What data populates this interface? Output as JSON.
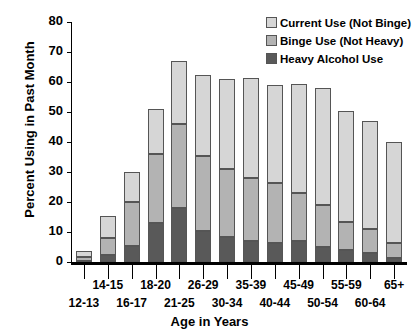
{
  "chart_data": {
    "type": "bar",
    "stacked": true,
    "title": "",
    "xlabel": "Age in Years",
    "ylabel": "Percent Using in Past Month",
    "ylim": [
      0,
      80
    ],
    "yticks": [
      0,
      10,
      20,
      30,
      40,
      50,
      60,
      70,
      80
    ],
    "grid": false,
    "legend_position": "top-right",
    "categories": [
      "12-13",
      "14-15",
      "16-17",
      "18-20",
      "21-25",
      "26-29",
      "30-34",
      "35-39",
      "40-44",
      "45-49",
      "50-54",
      "55-59",
      "60-64",
      "65+"
    ],
    "series": [
      {
        "name": "Heavy Alcohol Use",
        "color": "#595959",
        "values": [
          0.5,
          2.5,
          5.5,
          13.0,
          18.0,
          10.5,
          8.5,
          7.0,
          6.5,
          7.0,
          5.0,
          4.0,
          3.0,
          1.5
        ]
      },
      {
        "name": "Binge Use (Not Heavy)",
        "color": "#b3b3b3",
        "values": [
          1.2,
          5.5,
          14.5,
          23.0,
          28.0,
          25.0,
          22.5,
          21.0,
          20.0,
          16.0,
          14.0,
          9.5,
          8.0,
          5.0
        ]
      },
      {
        "name": "Current Use (Not Binge)",
        "color": "#d6d6d6",
        "values": [
          2.0,
          7.5,
          10.0,
          15.0,
          21.0,
          27.0,
          30.0,
          33.5,
          32.5,
          36.5,
          39.0,
          37.0,
          36.0,
          33.5
        ]
      }
    ],
    "totals": [
      3.7,
      15.5,
      30.0,
      51.0,
      67.0,
      62.5,
      61.0,
      61.5,
      59.0,
      59.5,
      58.0,
      50.5,
      47.0,
      40.0
    ],
    "cumulative_tops": {
      "heavy": [
        0.5,
        2.5,
        5.5,
        13.0,
        18.0,
        10.5,
        8.5,
        7.0,
        6.5,
        7.0,
        5.0,
        4.0,
        3.0,
        1.5
      ],
      "binge": [
        1.7,
        8.0,
        20.0,
        36.0,
        46.0,
        35.5,
        31.0,
        28.0,
        26.5,
        23.0,
        19.0,
        13.5,
        11.0,
        6.5
      ],
      "current": [
        3.7,
        15.5,
        30.0,
        51.0,
        67.0,
        62.5,
        61.0,
        61.5,
        59.0,
        59.5,
        58.0,
        50.5,
        47.0,
        40.0
      ]
    }
  },
  "axis": {
    "ylabel": "Percent Using in Past Month",
    "xlabel": "Age in Years",
    "yticks": [
      "80",
      "70",
      "60",
      "50",
      "40",
      "30",
      "20",
      "10",
      "0"
    ],
    "xticks_row_upper": [
      "14-15",
      "18-20",
      "26-29",
      "35-39",
      "45-49",
      "55-59",
      "65+"
    ],
    "xticks_row_lower": [
      "12-13",
      "16-17",
      "21-25",
      "30-34",
      "40-44",
      "50-54",
      "60-64"
    ]
  },
  "legend": {
    "items": [
      {
        "label": "Current Use (Not Binge)",
        "color": "#d6d6d6",
        "swatch": "legend-swatch-current"
      },
      {
        "label": "Binge Use (Not Heavy)",
        "color": "#b3b3b3",
        "swatch": "legend-swatch-binge"
      },
      {
        "label": "Heavy Alcohol Use",
        "color": "#595959",
        "swatch": "legend-swatch-heavy"
      }
    ]
  }
}
